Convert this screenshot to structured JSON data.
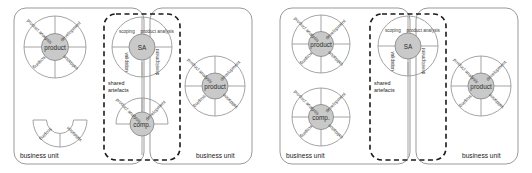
{
  "figure": {
    "title": "",
    "type": "diagram"
  },
  "colors": {
    "hub_fill": "#c9c9c9",
    "wheel_stroke": "#9a9a9a",
    "business_unit_stroke": "#999999",
    "dashed_box_stroke": "#1a1a1a",
    "text": "#222222",
    "background": "#ffffff"
  },
  "labels": {
    "business_unit": "business unit",
    "shared_artefacts_line1": "shared",
    "shared_artefacts_line2": "artefacts",
    "segment_product_analysis": "product analysis",
    "segment_development": "development",
    "segment_scoping": "scoping",
    "segment_validation": "validation",
    "hub_product": "product",
    "hub_sa": "SA",
    "hub_comp": "comp."
  },
  "diagrams": [
    {
      "id": "diagram-left",
      "business_units": [
        {
          "id": "bu-left-1",
          "label": "business unit"
        },
        {
          "id": "bu-left-2",
          "label": "business unit"
        }
      ],
      "shared_box": {
        "id": "shared-box-left",
        "label": "shared artefacts"
      },
      "wheels": [
        {
          "id": "wheel-left-product-top",
          "hub": "product",
          "rotation": 0,
          "completeness": "full",
          "segments": [
            "product analysis",
            "development",
            "scoping",
            "validation"
          ]
        },
        {
          "id": "wheel-left-partial-bottom",
          "hub": "",
          "rotation": 0,
          "completeness": "bottom-half-no-hub",
          "segments": [
            "scoping",
            "validation"
          ]
        },
        {
          "id": "wheel-left-sa",
          "hub": "SA",
          "rotation": 45,
          "completeness": "full",
          "segments": [
            "scoping",
            "product analysis",
            "validation",
            "development"
          ]
        },
        {
          "id": "wheel-left-comp",
          "hub": "comp.",
          "rotation": 0,
          "completeness": "top-half",
          "segments": [
            "product analysis",
            "development"
          ]
        },
        {
          "id": "wheel-left-product-right",
          "hub": "product",
          "rotation": 0,
          "completeness": "full",
          "segments": [
            "product analysis",
            "development",
            "scoping",
            "validation"
          ]
        }
      ]
    },
    {
      "id": "diagram-right",
      "business_units": [
        {
          "id": "bu-right-1",
          "label": "business unit"
        },
        {
          "id": "bu-right-2",
          "label": "business unit"
        }
      ],
      "shared_box": {
        "id": "shared-box-right",
        "label": "shared artefacts"
      },
      "wheels": [
        {
          "id": "wheel-right-product-top",
          "hub": "product",
          "rotation": 0,
          "completeness": "full",
          "segments": [
            "product analysis",
            "development",
            "scoping",
            "validation"
          ]
        },
        {
          "id": "wheel-right-comp",
          "hub": "comp.",
          "rotation": 0,
          "completeness": "full",
          "segments": [
            "product analysis",
            "development",
            "scoping",
            "validation"
          ]
        },
        {
          "id": "wheel-right-sa",
          "hub": "SA",
          "rotation": 45,
          "completeness": "full",
          "segments": [
            "scoping",
            "product analysis",
            "validation",
            "development"
          ]
        },
        {
          "id": "wheel-right-product-right",
          "hub": "product",
          "rotation": 0,
          "completeness": "full",
          "segments": [
            "product analysis",
            "development",
            "scoping",
            "validation"
          ]
        }
      ]
    }
  ]
}
